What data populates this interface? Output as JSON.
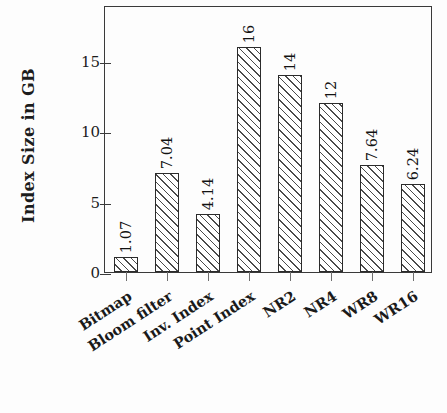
{
  "chart_data": {
    "type": "bar",
    "title": "",
    "subtitle": "",
    "xlabel": "",
    "ylabel": "Index Size in GB",
    "categories": [
      "Bitmap",
      "Bloom filter",
      "Inv. Index",
      "Point Index",
      "NR2",
      "NR4",
      "WR8",
      "WR16"
    ],
    "values": [
      1.07,
      7.04,
      4.14,
      16,
      14,
      12,
      7.64,
      6.24
    ],
    "value_labels": [
      "1.07",
      "7.04",
      "4.14",
      "16",
      "14",
      "12",
      "7.64",
      "6.24"
    ],
    "ylim": [
      0,
      19
    ],
    "yticks": [
      0,
      5,
      10,
      15
    ],
    "ytick_labels": [
      "0",
      "5",
      "10",
      "15"
    ],
    "grid": false,
    "legend": null,
    "legend_position": "none",
    "bar_style": {
      "fill": "#ffffff",
      "edge": "#2b2b2b",
      "hatch": "forward-slash"
    },
    "axis_color": "#3a3a3a",
    "background": "#fdfdfd",
    "label_rotation_deg": -90,
    "category_rotation_deg": -33
  }
}
